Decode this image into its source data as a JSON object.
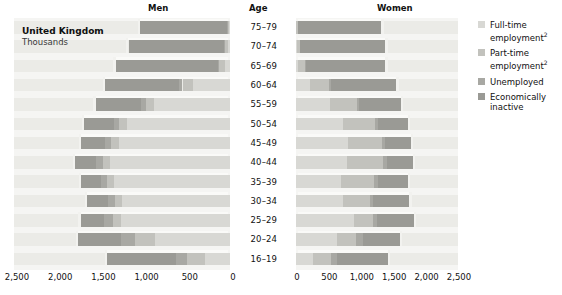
{
  "headers": {
    "men": "Men",
    "age": "Age",
    "women": "Women"
  },
  "title": {
    "main": "United Kingdom",
    "sub": "Thousands"
  },
  "legend": {
    "items": [
      {
        "key": "full_time",
        "label": "Full-time employment",
        "note": "2",
        "color": "#d8d8d4",
        "icon": "legend-swatch"
      },
      {
        "key": "part_time",
        "label": "Part-time employment",
        "note": "2",
        "color": "#c2c2bd",
        "icon": "legend-swatch"
      },
      {
        "key": "unemployed",
        "label": "Unemployed",
        "note": "",
        "color": "#a8a8a3",
        "icon": "legend-swatch"
      },
      {
        "key": "inactive",
        "label": "Economically inactive",
        "note": "",
        "color": "#9a9a95",
        "icon": "legend-swatch"
      }
    ]
  },
  "axes": {
    "men_ticks": [
      "2,500",
      "2,000",
      "1,500",
      "1,000",
      "500",
      "0"
    ],
    "women_ticks": [
      "0",
      "500",
      "1,000",
      "1,500",
      "2,000",
      "2,500"
    ],
    "max": 2500,
    "unit": "Thousands"
  },
  "chart_data": {
    "type": "bar",
    "title": "United Kingdom",
    "subtitle": "Thousands",
    "xlabel": "Thousands",
    "ylabel": "Age",
    "xlim": [
      0,
      2500
    ],
    "grid": false,
    "legend_position": "right",
    "categories": [
      "75-79",
      "70-74",
      "65-69",
      "60-64",
      "55-59",
      "50-54",
      "45-49",
      "40-44",
      "35-39",
      "30-34",
      "25-29",
      "20-24",
      "16-19"
    ],
    "series": [
      {
        "name": "Full-time employment",
        "panel": "men",
        "values": [
          10,
          25,
          55,
          430,
          880,
          1190,
          1290,
          1390,
          1340,
          1250,
          1260,
          870,
          290
        ]
      },
      {
        "name": "Part-time employment",
        "panel": "men",
        "values": [
          15,
          30,
          70,
          120,
          95,
          90,
          85,
          85,
          80,
          80,
          95,
          230,
          205
        ]
      },
      {
        "name": "Unemployed",
        "panel": "men",
        "values": [
          5,
          10,
          15,
          45,
          60,
          60,
          70,
          75,
          75,
          80,
          100,
          160,
          130
        ]
      },
      {
        "name": "Economically inactive",
        "panel": "men",
        "values": [
          1010,
          1110,
          1185,
          855,
          520,
          345,
          275,
          245,
          230,
          240,
          275,
          495,
          800
        ]
      },
      {
        "name": "Full-time employment",
        "panel": "women",
        "values": [
          5,
          15,
          35,
          215,
          520,
          730,
          810,
          790,
          700,
          730,
          890,
          640,
          265
        ]
      },
      {
        "name": "Part-time employment",
        "panel": "women",
        "values": [
          20,
          40,
          105,
          300,
          415,
          490,
          520,
          560,
          510,
          410,
          300,
          290,
          270
        ]
      },
      {
        "name": "Unemployed",
        "panel": "women",
        "values": [
          3,
          5,
          10,
          25,
          35,
          40,
          45,
          50,
          50,
          55,
          65,
          105,
          100
        ]
      },
      {
        "name": "Economically inactive",
        "panel": "women",
        "values": [
          1290,
          1320,
          1230,
          1010,
          655,
          465,
          395,
          400,
          470,
          555,
          560,
          565,
          785
        ]
      }
    ],
    "stack_order": [
      "Full-time employment",
      "Part-time employment",
      "Unemployed",
      "Economically inactive"
    ]
  }
}
